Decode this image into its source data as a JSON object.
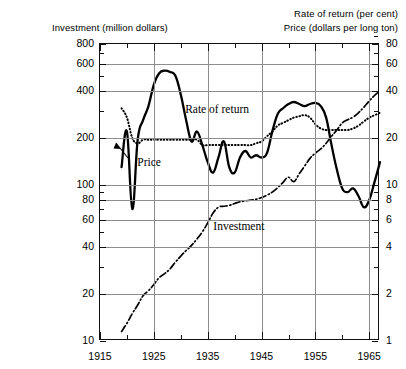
{
  "captions": {
    "left_top": "Investment  (million dollars)",
    "right_top": "Rate of return (per cent)",
    "right_bottom": "Price (dollars per long ton)"
  },
  "annotations": {
    "rate_of_return": "Rate of return",
    "price": "Price",
    "investment": "Investment"
  },
  "chart_data": {
    "type": "line",
    "title": "",
    "xlabel": "",
    "ylabel": "Investment (million dollars)",
    "y2label": "Rate of return (per cent) / Price (dollars per long ton)",
    "xlim": [
      1915,
      1967
    ],
    "x_ticks": [
      1915,
      1925,
      1935,
      1945,
      1955,
      1965
    ],
    "x_minor_ticks": [
      1920,
      1930,
      1940,
      1950,
      1960
    ],
    "yscale": "log",
    "ylim": [
      10,
      800
    ],
    "y_ticks_left": [
      10,
      20,
      40,
      60,
      80,
      100,
      200,
      400,
      600,
      800
    ],
    "y_ticks_right": [
      1,
      2,
      4,
      6,
      8,
      10,
      20,
      40,
      60,
      80
    ],
    "y_right_ratio": "right axis = left axis / 10",
    "grid": true,
    "grid_axis": "both",
    "legend": "inline annotations",
    "series": [
      {
        "name": "Rate of return",
        "style": "solid-thick",
        "axis": "right",
        "unit": "per cent",
        "x": [
          1919,
          1920,
          1921,
          1922,
          1923,
          1924,
          1925,
          1926,
          1927,
          1928,
          1929,
          1930,
          1931,
          1932,
          1933,
          1934,
          1935,
          1936,
          1937,
          1938,
          1939,
          1940,
          1941,
          1942,
          1943,
          1944,
          1945,
          1946,
          1947,
          1948,
          1949,
          1950,
          1951,
          1952,
          1953,
          1954,
          1955,
          1956,
          1957,
          1958,
          1959,
          1960,
          1961,
          1962,
          1963,
          1964,
          1965,
          1966,
          1967
        ],
        "values": [
          13.0,
          22.0,
          7.0,
          19.5,
          26.0,
          32.0,
          44.0,
          52.0,
          54.0,
          53.0,
          50.0,
          38.0,
          26.0,
          19.0,
          22.0,
          18.0,
          14.0,
          12.0,
          15.0,
          19.0,
          13.0,
          12.0,
          15.0,
          16.5,
          15.0,
          15.5,
          15.0,
          16.0,
          22.0,
          28.5,
          31.0,
          33.0,
          34.0,
          33.0,
          32.0,
          33.0,
          33.5,
          32.0,
          27.0,
          18.0,
          12.5,
          9.5,
          9.0,
          9.5,
          8.5,
          7.2,
          8.0,
          10.5,
          14.0
        ]
      },
      {
        "name": "Price",
        "style": "dotted",
        "axis": "right",
        "unit": "dollars per long ton",
        "x": [
          1919,
          1920,
          1921,
          1922,
          1923,
          1924,
          1925,
          1926,
          1927,
          1928,
          1929,
          1930,
          1931,
          1932,
          1933,
          1934,
          1935,
          1936,
          1937,
          1938,
          1939,
          1940,
          1941,
          1942,
          1943,
          1944,
          1945,
          1946,
          1947,
          1948,
          1949,
          1950,
          1951,
          1952,
          1953,
          1954,
          1955,
          1956,
          1957,
          1958,
          1959,
          1960,
          1961,
          1962,
          1963,
          1964,
          1965,
          1966,
          1967
        ],
        "values": [
          31.0,
          27.0,
          20.0,
          18.5,
          19.5,
          19.5,
          19.5,
          19.5,
          19.5,
          19.5,
          19.5,
          19.5,
          19.5,
          19.5,
          19.5,
          18.0,
          18.0,
          18.0,
          18.0,
          18.0,
          18.0,
          18.0,
          18.0,
          18.0,
          18.0,
          18.5,
          19.0,
          20.5,
          22.0,
          24.0,
          25.0,
          26.0,
          27.0,
          27.5,
          28.0,
          27.0,
          24.5,
          23.0,
          22.5,
          22.5,
          22.5,
          22.5,
          22.5,
          23.0,
          24.0,
          25.5,
          27.0,
          28.0,
          29.0
        ]
      },
      {
        "name": "Investment",
        "style": "dash-dot",
        "axis": "left",
        "unit": "million dollars",
        "x": [
          1919,
          1920,
          1921,
          1922,
          1923,
          1924,
          1925,
          1926,
          1927,
          1928,
          1929,
          1930,
          1931,
          1932,
          1933,
          1934,
          1935,
          1936,
          1937,
          1938,
          1939,
          1940,
          1941,
          1942,
          1943,
          1944,
          1945,
          1946,
          1947,
          1948,
          1949,
          1950,
          1951,
          1952,
          1953,
          1954,
          1955,
          1956,
          1957,
          1958,
          1959,
          1960,
          1961,
          1962,
          1963,
          1964,
          1965,
          1966,
          1967
        ],
        "values": [
          11.5,
          13.0,
          15.0,
          17.0,
          19.5,
          21.0,
          23.0,
          25.5,
          27.0,
          29.0,
          32.0,
          35.0,
          38.0,
          41.0,
          45.0,
          50.0,
          57.0,
          66.0,
          72.0,
          73.0,
          74.0,
          76.0,
          78.0,
          79.0,
          80.0,
          81.0,
          83.0,
          86.0,
          90.0,
          96.0,
          104.0,
          112.0,
          105.0,
          118.0,
          132.0,
          148.0,
          160.0,
          170.0,
          185.0,
          205.0,
          225.0,
          250.0,
          262.0,
          272.0,
          290.0,
          315.0,
          345.0,
          375.0,
          400.0
        ]
      }
    ]
  }
}
